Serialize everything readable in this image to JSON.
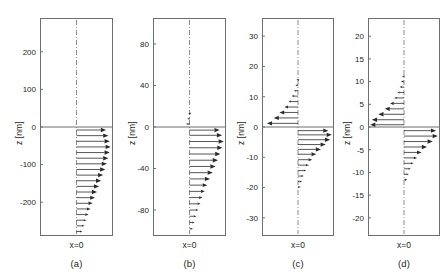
{
  "figure": {
    "background": "#ffffff",
    "ink": "#231f20",
    "axis_color": "#6d6e71",
    "arrow_color": "#2b2b2b",
    "centerline_color": "#8c8c8c"
  },
  "chart_data": [
    {
      "type": "quiver",
      "panel": "a",
      "label": "(a)",
      "ylabel": "z [nm]",
      "xlabel": "x=0",
      "ylim": [
        -290,
        290
      ],
      "yticks": [
        200,
        100,
        0,
        -100,
        -200
      ],
      "ytick_labels": [
        "200",
        "100",
        "0",
        "-100",
        "-200"
      ],
      "xlim": [
        -1,
        1
      ],
      "grid": false,
      "interface_z": 0,
      "centerline_x": 0,
      "arrows_upper": [],
      "arrows_lower": [
        {
          "z": -8,
          "u": 0.86
        },
        {
          "z": -23,
          "u": 0.93
        },
        {
          "z": -38,
          "u": 0.97
        },
        {
          "z": -53,
          "u": 1.0
        },
        {
          "z": -68,
          "u": 0.97
        },
        {
          "z": -83,
          "u": 0.93
        },
        {
          "z": -98,
          "u": 0.89
        },
        {
          "z": -113,
          "u": 0.84
        },
        {
          "z": -128,
          "u": 0.78
        },
        {
          "z": -143,
          "u": 0.72
        },
        {
          "z": -158,
          "u": 0.66
        },
        {
          "z": -173,
          "u": 0.6
        },
        {
          "z": -188,
          "u": 0.54
        },
        {
          "z": -203,
          "u": 0.47
        },
        {
          "z": -218,
          "u": 0.41
        },
        {
          "z": -233,
          "u": 0.35
        },
        {
          "z": -248,
          "u": 0.29
        },
        {
          "z": -263,
          "u": 0.23
        },
        {
          "z": -278,
          "u": 0.17
        }
      ]
    },
    {
      "type": "quiver",
      "panel": "b",
      "label": "(b)",
      "ylabel": "z [nm]",
      "xlabel": "x=0",
      "ylim": [
        -105,
        105
      ],
      "yticks": [
        80,
        40,
        0,
        -40,
        -80
      ],
      "ytick_labels": [
        "80",
        "40",
        "0",
        "-40",
        "-80"
      ],
      "xlim": [
        -1,
        1
      ],
      "grid": false,
      "interface_z": 0,
      "centerline_x": 0,
      "arrows_upper": [
        {
          "z": 3,
          "u": -0.1
        },
        {
          "z": 8,
          "u": -0.07
        },
        {
          "z": 13,
          "u": -0.04
        }
      ],
      "arrows_lower": [
        {
          "z": -3,
          "u": 0.88
        },
        {
          "z": -8,
          "u": 0.95
        },
        {
          "z": -14,
          "u": 1.0
        },
        {
          "z": -20,
          "u": 0.96
        },
        {
          "z": -26,
          "u": 0.9
        },
        {
          "z": -32,
          "u": 0.83
        },
        {
          "z": -38,
          "u": 0.76
        },
        {
          "z": -44,
          "u": 0.68
        },
        {
          "z": -50,
          "u": 0.6
        },
        {
          "z": -56,
          "u": 0.52
        },
        {
          "z": -62,
          "u": 0.45
        },
        {
          "z": -68,
          "u": 0.38
        },
        {
          "z": -74,
          "u": 0.32
        },
        {
          "z": -80,
          "u": 0.26
        },
        {
          "z": -86,
          "u": 0.2
        },
        {
          "z": -92,
          "u": 0.15
        },
        {
          "z": -98,
          "u": 0.1
        }
      ]
    },
    {
      "type": "quiver",
      "panel": "c",
      "label": "(c)",
      "ylabel": "z [nm]",
      "xlabel": "x=0",
      "ylim": [
        -36,
        36
      ],
      "yticks": [
        30,
        20,
        10,
        0,
        -10,
        -20,
        -30
      ],
      "ytick_labels": [
        "30",
        "20",
        "10",
        "0",
        "-10",
        "-20",
        "-30"
      ],
      "xlim": [
        -1,
        1
      ],
      "grid": false,
      "interface_z": 0,
      "centerline_x": 0,
      "arrows_upper": [
        {
          "z": 1.2,
          "u": -0.92
        },
        {
          "z": 3.0,
          "u": -0.72
        },
        {
          "z": 4.8,
          "u": -0.55
        },
        {
          "z": 6.6,
          "u": -0.4
        },
        {
          "z": 8.4,
          "u": -0.28
        },
        {
          "z": 10.2,
          "u": -0.19
        },
        {
          "z": 12.0,
          "u": -0.12
        },
        {
          "z": 13.8,
          "u": -0.08
        },
        {
          "z": 15.6,
          "u": -0.05
        },
        {
          "z": 17.4,
          "u": -0.03
        }
      ],
      "arrows_lower": [
        {
          "z": -1.2,
          "u": 0.9
        },
        {
          "z": -2.6,
          "u": 1.0
        },
        {
          "z": -4.2,
          "u": 0.95
        },
        {
          "z": -5.8,
          "u": 0.82
        },
        {
          "z": -7.4,
          "u": 0.68
        },
        {
          "z": -9.0,
          "u": 0.54
        },
        {
          "z": -10.8,
          "u": 0.42
        },
        {
          "z": -12.6,
          "u": 0.32
        },
        {
          "z": -14.4,
          "u": 0.24
        },
        {
          "z": -16.2,
          "u": 0.17
        },
        {
          "z": -18.0,
          "u": 0.12
        },
        {
          "z": -19.8,
          "u": 0.08
        }
      ]
    },
    {
      "type": "quiver",
      "panel": "d",
      "label": "(d)",
      "ylabel": "z [nm]",
      "xlabel": "x=0",
      "ylim": [
        -24,
        24
      ],
      "yticks": [
        20,
        15,
        10,
        5,
        0,
        -5,
        -10,
        -15,
        -20
      ],
      "ytick_labels": [
        "20",
        "15",
        "10",
        "5",
        "0",
        "-5",
        "-10",
        "-15",
        "-20"
      ],
      "xlim": [
        -1,
        1
      ],
      "grid": false,
      "interface_z": 0,
      "centerline_x": 0,
      "arrows_upper": [
        {
          "z": 0.5,
          "u": -1.0
        },
        {
          "z": 1.6,
          "u": -0.95
        },
        {
          "z": 2.8,
          "u": -0.76
        },
        {
          "z": 4.0,
          "u": -0.57
        },
        {
          "z": 5.2,
          "u": -0.41
        },
        {
          "z": 6.4,
          "u": -0.29
        },
        {
          "z": 7.6,
          "u": -0.2
        },
        {
          "z": 8.8,
          "u": -0.13
        },
        {
          "z": 10.0,
          "u": -0.09
        },
        {
          "z": 11.2,
          "u": -0.06
        }
      ],
      "arrows_lower": [
        {
          "z": -0.8,
          "u": 0.95
        },
        {
          "z": -2.0,
          "u": 1.0
        },
        {
          "z": -3.2,
          "u": 0.85
        },
        {
          "z": -4.4,
          "u": 0.68
        },
        {
          "z": -5.6,
          "u": 0.52
        },
        {
          "z": -6.8,
          "u": 0.39
        },
        {
          "z": -8.0,
          "u": 0.28
        },
        {
          "z": -9.2,
          "u": 0.2
        },
        {
          "z": -10.4,
          "u": 0.14
        },
        {
          "z": -11.6,
          "u": 0.1
        }
      ]
    }
  ]
}
